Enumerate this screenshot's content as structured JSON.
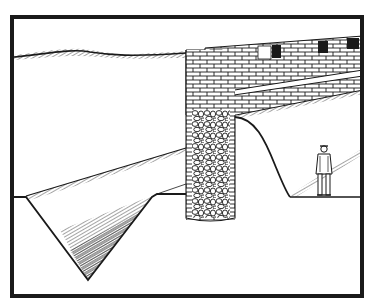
{
  "image": {
    "description": "Black-and-white ink illustration of a stone castle wall cross-section with crenellated battlement, a rubble-filled tower pier, a V-shaped ditch in front, a sloped embankment, and a small standing figure behind the wall",
    "style": "pen-and-ink line drawing with hatching",
    "colors": {
      "ink": "#1a1a1a",
      "paper": "#ffffff"
    },
    "elements": [
      "frame-border",
      "horizon-hill-line",
      "crenellated-wall",
      "wall-walkway",
      "rubble-pier",
      "glacis-slope",
      "v-ditch",
      "rampart-curve",
      "standing-figure",
      "ground-line"
    ]
  }
}
